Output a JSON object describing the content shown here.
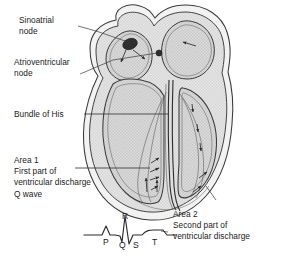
{
  "figure": {
    "background_color": "#ffffff",
    "width": 281,
    "height": 262
  },
  "labels": {
    "sinoatrial_node": "Sinoatrial\nnode",
    "atrioventricular_node": "Atrioventricular\nnode",
    "bundle_of_his": "Bundle of His",
    "area1": "Area 1\nFirst part of\nventricular discharge\nQ wave",
    "area2": "Area 2\nSecond part of\nventricular discharge"
  },
  "ecg": {
    "letters": {
      "P": "P",
      "Q": "Q",
      "R": "R",
      "S": "S",
      "T": "T"
    }
  },
  "colors": {
    "outline": "#2b2b2b",
    "myocardium_fill": "#d4d4d4",
    "chamber_fill": "#e2e2e2",
    "epicardium_fill": "#efefef",
    "node_fill": "#2e2e2e",
    "text": "#1a1a1a",
    "leader_line": "#3a3a3a",
    "trace": "#2b2b2b"
  },
  "anatomy": {
    "sinoatrial_node_marker": "sa-node",
    "atrioventricular_node_marker": "av-node",
    "arrows": [
      "atrial-spread-left",
      "atrial-spread-down",
      "atrial-spread-right",
      "septal-down-1",
      "septal-down-2",
      "septal-down-3",
      "apex-up-1",
      "apex-up-2",
      "apex-up-3",
      "apex-up-4",
      "apex-up-5",
      "lateral-wall-1",
      "lateral-wall-2"
    ]
  }
}
